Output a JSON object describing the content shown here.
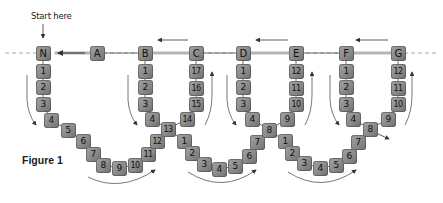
{
  "labels": {
    "start": "Start here",
    "figure": "Figure 1"
  },
  "colors": {
    "bead": "#8a8a8a",
    "guide_line": "#9a9a9a",
    "cord": "#444444",
    "arrow": "#333333",
    "text": "#111111"
  },
  "guide_line_y": 53,
  "beads": [
    {
      "id": "N",
      "label": "N",
      "x": 43,
      "y": 53
    },
    {
      "id": "A",
      "label": "A",
      "x": 97,
      "y": 53
    },
    {
      "id": "B",
      "label": "B",
      "x": 145,
      "y": 53
    },
    {
      "id": "C",
      "label": "C",
      "x": 196,
      "y": 53
    },
    {
      "id": "D",
      "label": "D",
      "x": 243,
      "y": 53
    },
    {
      "id": "E",
      "label": "E",
      "x": 296,
      "y": 53
    },
    {
      "id": "F",
      "label": "F",
      "x": 346,
      "y": 53
    },
    {
      "id": "G",
      "label": "G",
      "x": 398,
      "y": 53
    },
    {
      "id": "l1-1",
      "label": "1",
      "x": 43,
      "y": 71
    },
    {
      "id": "l1-2",
      "label": "2",
      "x": 43,
      "y": 87
    },
    {
      "id": "l1-3",
      "label": "3",
      "x": 43,
      "y": 104
    },
    {
      "id": "l1-4",
      "label": "4",
      "x": 51,
      "y": 120
    },
    {
      "id": "l1-5",
      "label": "5",
      "x": 68,
      "y": 130
    },
    {
      "id": "l1-6",
      "label": "6",
      "x": 83,
      "y": 141
    },
    {
      "id": "l1-7",
      "label": "7",
      "x": 93,
      "y": 154
    },
    {
      "id": "l1-8",
      "label": "8",
      "x": 103,
      "y": 165
    },
    {
      "id": "l1-9",
      "label": "9",
      "x": 119,
      "y": 168
    },
    {
      "id": "l1-10",
      "label": "10",
      "x": 135,
      "y": 165
    },
    {
      "id": "l1-11",
      "label": "11",
      "x": 148,
      "y": 154
    },
    {
      "id": "l1-12",
      "label": "12",
      "x": 157,
      "y": 141
    },
    {
      "id": "l1-13",
      "label": "13",
      "x": 168,
      "y": 129
    },
    {
      "id": "b-1",
      "label": "1",
      "x": 145,
      "y": 71
    },
    {
      "id": "b-2",
      "label": "2",
      "x": 145,
      "y": 87
    },
    {
      "id": "b-3",
      "label": "3",
      "x": 145,
      "y": 104
    },
    {
      "id": "b-4",
      "label": "4",
      "x": 152,
      "y": 119
    },
    {
      "id": "c-17",
      "label": "17",
      "x": 196,
      "y": 71
    },
    {
      "id": "c-16",
      "label": "16",
      "x": 196,
      "y": 88
    },
    {
      "id": "c-15",
      "label": "15",
      "x": 196,
      "y": 104
    },
    {
      "id": "c-14",
      "label": "14",
      "x": 187,
      "y": 119
    },
    {
      "id": "l2-1",
      "label": "1",
      "x": 184,
      "y": 141
    },
    {
      "id": "l2-2",
      "label": "2",
      "x": 192,
      "y": 153
    },
    {
      "id": "l2-3",
      "label": "3",
      "x": 204,
      "y": 164
    },
    {
      "id": "l2-4",
      "label": "4",
      "x": 219,
      "y": 169
    },
    {
      "id": "l2-5",
      "label": "5",
      "x": 235,
      "y": 166
    },
    {
      "id": "l2-6",
      "label": "6",
      "x": 249,
      "y": 156
    },
    {
      "id": "l2-7",
      "label": "7",
      "x": 257,
      "y": 142
    },
    {
      "id": "l2-8",
      "label": "8",
      "x": 269,
      "y": 130
    },
    {
      "id": "d-1",
      "label": "1",
      "x": 243,
      "y": 71
    },
    {
      "id": "d-2",
      "label": "2",
      "x": 243,
      "y": 87
    },
    {
      "id": "d-3",
      "label": "3",
      "x": 243,
      "y": 104
    },
    {
      "id": "d-4",
      "label": "4",
      "x": 252,
      "y": 119
    },
    {
      "id": "e-12",
      "label": "12",
      "x": 296,
      "y": 71
    },
    {
      "id": "e-11",
      "label": "11",
      "x": 296,
      "y": 88
    },
    {
      "id": "e-10",
      "label": "10",
      "x": 296,
      "y": 104
    },
    {
      "id": "e-9",
      "label": "9",
      "x": 287,
      "y": 119
    },
    {
      "id": "l3-1",
      "label": "1",
      "x": 285,
      "y": 141
    },
    {
      "id": "l3-2",
      "label": "2",
      "x": 292,
      "y": 153
    },
    {
      "id": "l3-3",
      "label": "3",
      "x": 304,
      "y": 163
    },
    {
      "id": "l3-4",
      "label": "4",
      "x": 320,
      "y": 168
    },
    {
      "id": "l3-5",
      "label": "5",
      "x": 336,
      "y": 165
    },
    {
      "id": "l3-6",
      "label": "6",
      "x": 349,
      "y": 156
    },
    {
      "id": "l3-7",
      "label": "7",
      "x": 358,
      "y": 142
    },
    {
      "id": "l3-8",
      "label": "8",
      "x": 370,
      "y": 129
    },
    {
      "id": "f-1",
      "label": "1",
      "x": 346,
      "y": 71
    },
    {
      "id": "f-2",
      "label": "2",
      "x": 346,
      "y": 87
    },
    {
      "id": "f-3",
      "label": "3",
      "x": 346,
      "y": 104
    },
    {
      "id": "f-4",
      "label": "4",
      "x": 353,
      "y": 119
    },
    {
      "id": "g-12",
      "label": "12",
      "x": 398,
      "y": 71
    },
    {
      "id": "g-11",
      "label": "11",
      "x": 398,
      "y": 88
    },
    {
      "id": "g-10",
      "label": "10",
      "x": 398,
      "y": 104
    },
    {
      "id": "g-9",
      "label": "9",
      "x": 388,
      "y": 119
    }
  ],
  "cords": [
    [
      "N",
      "l1-1",
      "l1-2",
      "l1-3",
      "l1-4",
      "l1-5",
      "l1-6",
      "l1-7",
      "l1-8",
      "l1-9",
      "l1-10",
      "l1-11",
      "l1-12",
      "l1-13",
      "c-14",
      "c-15",
      "c-16",
      "c-17",
      "C"
    ],
    [
      "B",
      "b-1",
      "b-2",
      "b-3",
      "b-4",
      "l1-13",
      "l2-1",
      "l2-2",
      "l2-3",
      "l2-4",
      "l2-5",
      "l2-6",
      "l2-7",
      "l2-8",
      "e-9",
      "e-10",
      "e-11",
      "e-12",
      "E"
    ],
    [
      "D",
      "d-1",
      "d-2",
      "d-3",
      "d-4",
      "l2-8",
      "l3-1",
      "l3-2",
      "l3-3",
      "l3-4",
      "l3-5",
      "l3-6",
      "l3-7",
      "l3-8",
      "g-9",
      "g-10",
      "g-11",
      "g-12",
      "G"
    ],
    [
      "F",
      "f-1",
      "f-2",
      "f-3",
      "f-4",
      "l3-8"
    ],
    [
      "A",
      "B"
    ],
    [
      "C",
      "D"
    ],
    [
      "E",
      "F"
    ]
  ]
}
